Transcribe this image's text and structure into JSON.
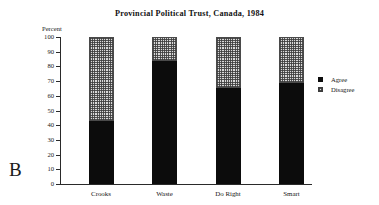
{
  "panel": {
    "letter": "B"
  },
  "chart_data": {
    "type": "bar",
    "subtype": "stacked-100",
    "title": "Provincial Political Trust, Canada, 1984",
    "xlabel": "",
    "ylabel": "Percent",
    "ylim": [
      0,
      100
    ],
    "ytick_step": 10,
    "yticks": [
      "100",
      "90",
      "80",
      "70",
      "60",
      "50",
      "40",
      "30",
      "20",
      "10",
      "0"
    ],
    "grid": false,
    "legend_position": "right",
    "categories": [
      "Crooks",
      "Waste",
      "Do Right",
      "Smart"
    ],
    "series": [
      {
        "name": "Agree",
        "color": "#0c0c0c",
        "pattern": "solid-black",
        "values": [
          43,
          84,
          65,
          69
        ]
      },
      {
        "name": "Disagree",
        "color": "#d9d9d9",
        "pattern": "cross-hatch-grid",
        "values": [
          57,
          16,
          35,
          31
        ]
      }
    ]
  },
  "legend": {
    "items": [
      {
        "label": "Agree",
        "swatch": "agree"
      },
      {
        "label": "Disagree",
        "swatch": "disagree"
      }
    ]
  }
}
